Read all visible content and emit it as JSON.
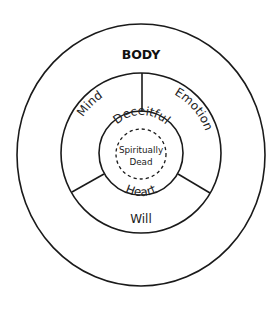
{
  "diagram": {
    "title": "BODY",
    "outer_ring": {
      "label": "BODY"
    },
    "soul_sectors": [
      {
        "id": "mind",
        "label": "Mind"
      },
      {
        "id": "emotion",
        "label": "Emotion"
      },
      {
        "id": "will",
        "label": "Will"
      }
    ],
    "heart": {
      "top_label": "Deceitful",
      "bottom_label": "Heart"
    },
    "core": {
      "line1": "Spiritually",
      "line2": "Dead"
    },
    "colors": {
      "stroke": "#1a1a1a",
      "text": "#222222",
      "background": "#ffffff"
    }
  }
}
